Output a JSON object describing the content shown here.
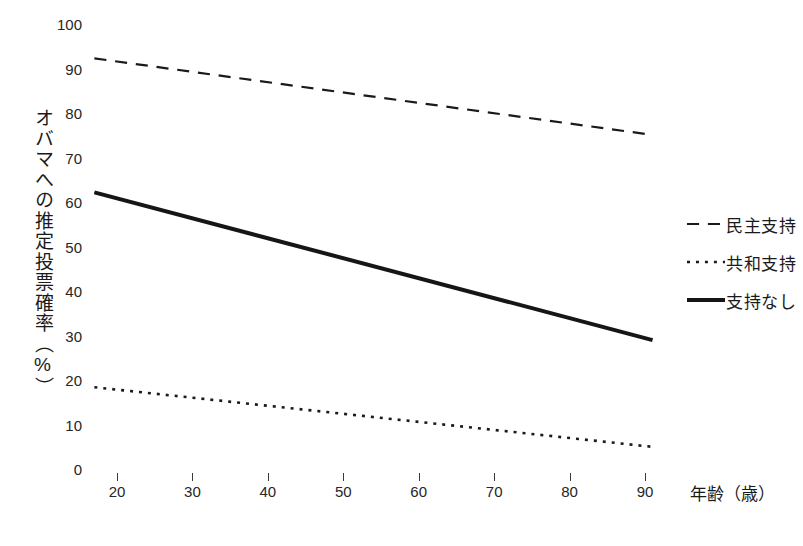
{
  "chart_data": {
    "type": "line",
    "title": "",
    "xlabel": "年齢（歳）",
    "ylabel": "オバマへの推定投票確率（%）",
    "xlim": [
      13,
      95
    ],
    "ylim": [
      0,
      100
    ],
    "grid": false,
    "legend_position": "right",
    "xticks": [
      20,
      30,
      40,
      50,
      60,
      70,
      80,
      90
    ],
    "xtick_labels": [
      "20",
      "30",
      "40",
      "50",
      "60",
      "70",
      "80",
      "90"
    ],
    "yticks": [
      0,
      10,
      20,
      30,
      40,
      50,
      60,
      70,
      80,
      90,
      100
    ],
    "ytick_labels": [
      "0",
      "10",
      "20",
      "30",
      "40",
      "50",
      "60",
      "70",
      "80",
      "90",
      "100"
    ],
    "x": [
      17,
      91
    ],
    "series": [
      {
        "name": "民主支持",
        "style": "dashed",
        "color": "#1a1a1a",
        "width": 2.2,
        "values": [
          92.5,
          75.3
        ]
      },
      {
        "name": "共和支持",
        "style": "dotted",
        "color": "#1a1a1a",
        "width": 2.6,
        "values": [
          18.6,
          5.2
        ]
      },
      {
        "name": "支持なし",
        "style": "solid",
        "color": "#161616",
        "width": 4.0,
        "values": [
          62.4,
          29.2
        ]
      }
    ]
  },
  "legend": {
    "items": [
      {
        "label": "民主支持",
        "style": "dashed"
      },
      {
        "label": "共和支持",
        "style": "dotted"
      },
      {
        "label": "支持なし",
        "style": "solid"
      }
    ]
  },
  "axes": {
    "y_axis_title": "オバマへの推定投票確率（%）",
    "x_axis_title": "年齢（歳）"
  }
}
